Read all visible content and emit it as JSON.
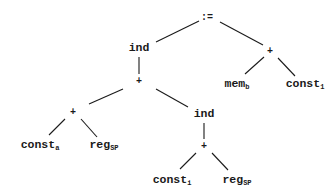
{
  "diagram": {
    "type": "expression-tree",
    "nodes": {
      "root": {
        "label": ":=",
        "sub": ""
      },
      "ind_top": {
        "label": "ind",
        "sub": ""
      },
      "plus_right": {
        "label": "+",
        "sub": ""
      },
      "plus_mid": {
        "label": "+",
        "sub": ""
      },
      "mem_b": {
        "label": "mem",
        "sub": "b"
      },
      "const_1": {
        "label": "const",
        "sub": "1"
      },
      "plus_left": {
        "label": "+",
        "sub": ""
      },
      "ind_low": {
        "label": "ind",
        "sub": ""
      },
      "const_a": {
        "label": "const",
        "sub": "a"
      },
      "reg_sp_1": {
        "label": "reg",
        "sub": "SP"
      },
      "plus_low": {
        "label": "+",
        "sub": ""
      },
      "const_i": {
        "label": "const",
        "sub": "i"
      },
      "reg_sp_2": {
        "label": "reg",
        "sub": "SP"
      }
    },
    "edges": [
      [
        "root",
        "ind_top"
      ],
      [
        "root",
        "plus_right"
      ],
      [
        "plus_right",
        "mem_b"
      ],
      [
        "plus_right",
        "const_1"
      ],
      [
        "ind_top",
        "plus_mid"
      ],
      [
        "plus_mid",
        "plus_left"
      ],
      [
        "plus_mid",
        "ind_low"
      ],
      [
        "plus_left",
        "const_a"
      ],
      [
        "plus_left",
        "reg_sp_1"
      ],
      [
        "ind_low",
        "plus_low"
      ],
      [
        "plus_low",
        "const_i"
      ],
      [
        "plus_low",
        "reg_sp_2"
      ]
    ]
  }
}
